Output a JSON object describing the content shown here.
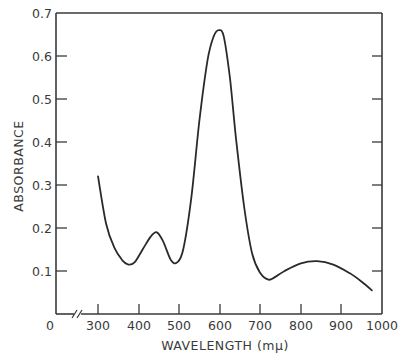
{
  "chart_data": {
    "type": "line",
    "title": "",
    "xlabel": "WAVELENGTH (mμ)",
    "ylabel": "ABSORBANCE",
    "xlim": [
      0,
      1000
    ],
    "ylim": [
      0,
      0.7
    ],
    "x_axis_break": true,
    "x_ticks": [
      "0",
      "300",
      "400",
      "500",
      "600",
      "700",
      "800",
      "900",
      "1000"
    ],
    "y_ticks": [
      "0.1",
      "0.2",
      "0.3",
      "0.4",
      "0.5",
      "0.6",
      "0.7"
    ],
    "grid": false,
    "legend": null,
    "series": [
      {
        "name": "absorbance",
        "x": [
          300,
          320,
          340,
          360,
          375,
          390,
          410,
          430,
          445,
          460,
          480,
          495,
          510,
          530,
          550,
          570,
          585,
          598,
          610,
          625,
          640,
          660,
          680,
          700,
          720,
          735,
          760,
          800,
          840,
          880,
          920,
          950,
          975
        ],
        "y": [
          0.32,
          0.21,
          0.155,
          0.125,
          0.115,
          0.12,
          0.15,
          0.18,
          0.19,
          0.17,
          0.125,
          0.12,
          0.15,
          0.27,
          0.45,
          0.59,
          0.645,
          0.66,
          0.645,
          0.55,
          0.41,
          0.25,
          0.14,
          0.095,
          0.08,
          0.085,
          0.1,
          0.118,
          0.123,
          0.115,
          0.095,
          0.075,
          0.055
        ]
      }
    ]
  },
  "labels": {
    "x_title": "WAVELENGTH (mμ)",
    "y_title": "ABSORBANCE",
    "zero": "0",
    "x300": "300",
    "x400": "400",
    "x500": "500",
    "x600": "600",
    "x700": "700",
    "x800": "800",
    "x900": "900",
    "x1000": "1000",
    "y01": "0.1",
    "y02": "0.2",
    "y03": "0.3",
    "y04": "0.4",
    "y05": "0.5",
    "y06": "0.6",
    "y07": "0.7"
  }
}
